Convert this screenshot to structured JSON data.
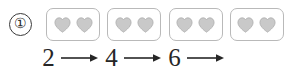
{
  "item": {
    "number_label": "①",
    "number_value": "1"
  },
  "picture_row": {
    "icon_name": "heart-icon",
    "icon_color": "#c9c9c9",
    "icon_outline_color": "#aeaeae",
    "box_border_color": "#b9b9b9",
    "hearts_per_box": 2,
    "boxes": [
      {
        "count_label": "2"
      },
      {
        "count_label": "2"
      },
      {
        "count_label": "2"
      },
      {
        "count_label": "2"
      }
    ]
  },
  "sequence": {
    "arrow_name": "right-arrow-icon",
    "arrow_color": "#262626",
    "steps": [
      {
        "type": "number",
        "label": "2"
      },
      {
        "type": "arrow",
        "label": "→"
      },
      {
        "type": "number",
        "label": "4"
      },
      {
        "type": "arrow",
        "label": "→"
      },
      {
        "type": "number",
        "label": "6"
      },
      {
        "type": "arrow",
        "label": "→"
      }
    ]
  },
  "colors": {
    "background": "#ffffff",
    "ink": "#262626"
  }
}
